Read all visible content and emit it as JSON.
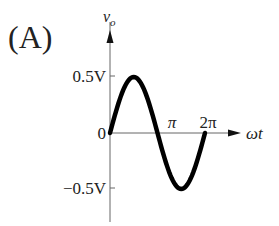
{
  "panel_label": "(A)",
  "chart_data": {
    "type": "line",
    "title": "(A)",
    "xlabel": "ωt",
    "ylabel": "v_o",
    "ylabel_main": "v",
    "ylabel_sub": "o",
    "x_ticks": [
      "π",
      "2π"
    ],
    "y_ticks": [
      "0.5V",
      "0",
      "−0.5V"
    ],
    "series": [
      {
        "name": "v_o",
        "function": "0.5·sin(ωt)",
        "x": [
          0,
          0.785,
          1.571,
          2.356,
          3.142,
          3.927,
          4.712,
          5.498,
          6.283
        ],
        "values": [
          0,
          0.354,
          0.5,
          0.354,
          0,
          -0.354,
          -0.5,
          -0.354,
          0
        ]
      }
    ],
    "xlim": [
      0,
      6.283
    ],
    "ylim": [
      -0.5,
      0.5
    ],
    "amplitude_V": 0.5,
    "grid": false,
    "legend": "none"
  }
}
